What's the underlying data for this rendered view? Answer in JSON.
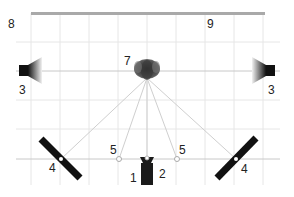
{
  "diagram": {
    "title": "",
    "colors": {
      "background": "#ffffff",
      "grid": "#e6e6e6",
      "top_bar": "#a9a9a9",
      "sight_lines": "#cfcfcf",
      "axis_line": "#c8c8c8",
      "equipment": "#1a1a1a"
    },
    "labels": {
      "camera_left": "1",
      "camera_right": "2",
      "speaker_left": "3",
      "speaker_right": "3",
      "reflector_left": "4",
      "reflector_right": "4",
      "marker_left": "5",
      "marker_right": "5",
      "subject": "7",
      "area_left": "8",
      "area_right": "9"
    },
    "elements": [
      {
        "id": "1",
        "name": "camera-left-side"
      },
      {
        "id": "2",
        "name": "camera-right-side"
      },
      {
        "id": "3",
        "name": "side-light"
      },
      {
        "id": "4",
        "name": "reflector-panel"
      },
      {
        "id": "5",
        "name": "position-marker"
      },
      {
        "id": "7",
        "name": "subject-head"
      },
      {
        "id": "8",
        "name": "area-label-left"
      },
      {
        "id": "9",
        "name": "area-label-right"
      }
    ]
  }
}
